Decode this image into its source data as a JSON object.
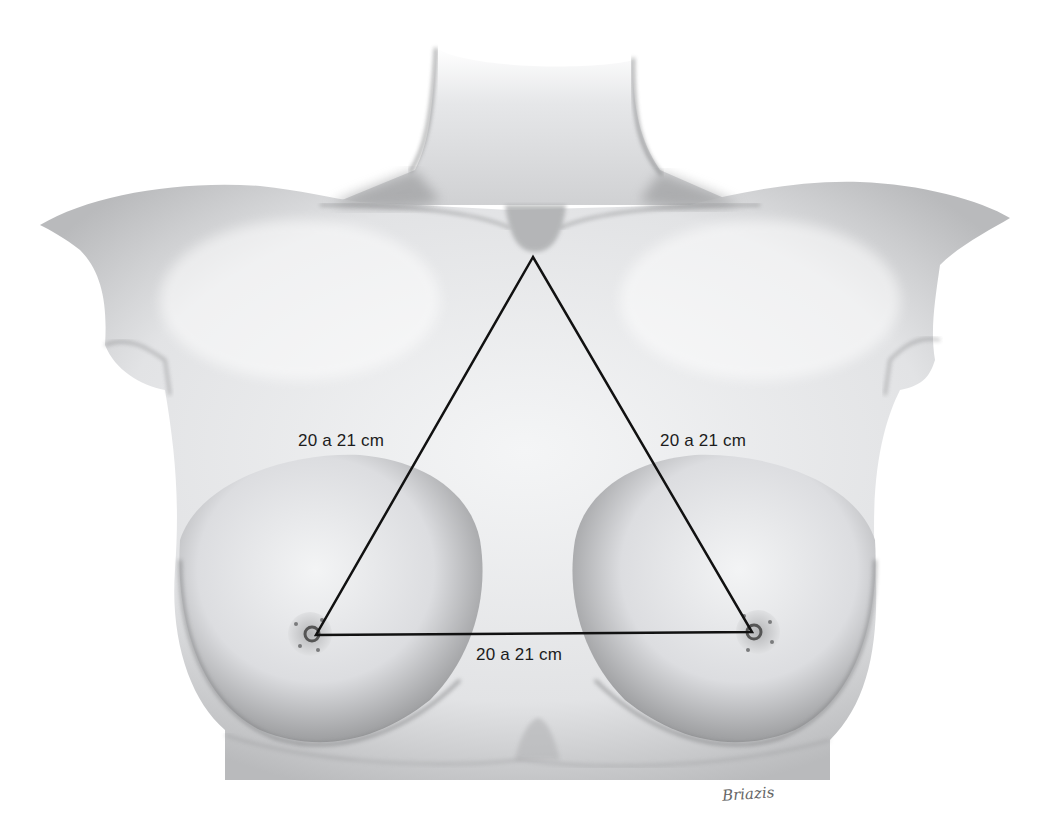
{
  "figure": {
    "measurements": {
      "left_side": "20 a 21 cm",
      "right_side": "20 a 21 cm",
      "base": "20 a 21 cm"
    },
    "triangle": {
      "apex": {
        "x": 533,
        "y": 257,
        "landmark": "suprasternal notch"
      },
      "left_vertex": {
        "x": 316,
        "y": 635,
        "landmark": "left nipple"
      },
      "right_vertex": {
        "x": 752,
        "y": 632,
        "landmark": "right nipple"
      },
      "stroke_color": "#111111"
    },
    "signature": "Briazis",
    "colors": {
      "background": "#ffffff",
      "skin_light": "#f1f2f3",
      "skin_shadow": "#8a8a8c",
      "line": "#111111",
      "label_text": "#1c1c1c"
    }
  }
}
